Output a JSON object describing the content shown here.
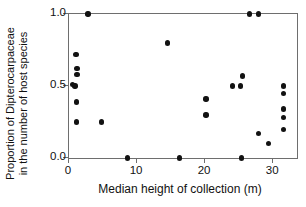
{
  "chart_data": {
    "type": "scatter",
    "title": "",
    "xlabel": "Median height of collection (m)",
    "ylabel": "Proportion of Dipterocarpaceae in the number of host species",
    "ylabel_line1": "Proportion of Dipterocarpaceae",
    "ylabel_line2": "in the number of host species",
    "xlim": [
      0,
      33.5
    ],
    "ylim": [
      0.0,
      1.0
    ],
    "xticks": [
      0,
      10,
      20,
      30
    ],
    "xticklabels": [
      "0",
      "10",
      "20",
      "30"
    ],
    "yticks": [
      0.0,
      0.5,
      1.0
    ],
    "yticklabels": [
      "0.0",
      "0.5",
      "1.0"
    ],
    "grid": false,
    "legend": false,
    "marker": "filled-circle",
    "marker_color": "#121212",
    "frame_color": "#6e6e6e",
    "background": "#ffffff",
    "points": [
      {
        "x": 2.8,
        "y": 1.0
      },
      {
        "x": 26.5,
        "y": 1.0
      },
      {
        "x": 27.8,
        "y": 1.0
      },
      {
        "x": 14.5,
        "y": 0.8
      },
      {
        "x": 1.0,
        "y": 0.72
      },
      {
        "x": 1.2,
        "y": 0.62
      },
      {
        "x": 1.2,
        "y": 0.58
      },
      {
        "x": 0.5,
        "y": 0.51
      },
      {
        "x": 0.9,
        "y": 0.5
      },
      {
        "x": 1.1,
        "y": 0.39
      },
      {
        "x": 1.1,
        "y": 0.25
      },
      {
        "x": 4.8,
        "y": 0.25
      },
      {
        "x": 20.1,
        "y": 0.41
      },
      {
        "x": 20.1,
        "y": 0.3
      },
      {
        "x": 24.0,
        "y": 0.5
      },
      {
        "x": 25.2,
        "y": 0.5
      },
      {
        "x": 25.5,
        "y": 0.57
      },
      {
        "x": 31.5,
        "y": 0.5
      },
      {
        "x": 31.5,
        "y": 0.45
      },
      {
        "x": 31.5,
        "y": 0.34
      },
      {
        "x": 31.5,
        "y": 0.28
      },
      {
        "x": 31.5,
        "y": 0.2
      },
      {
        "x": 27.8,
        "y": 0.17
      },
      {
        "x": 29.3,
        "y": 0.1
      },
      {
        "x": 8.6,
        "y": 0.0
      },
      {
        "x": 16.2,
        "y": 0.0
      },
      {
        "x": 25.3,
        "y": 0.0
      }
    ]
  }
}
